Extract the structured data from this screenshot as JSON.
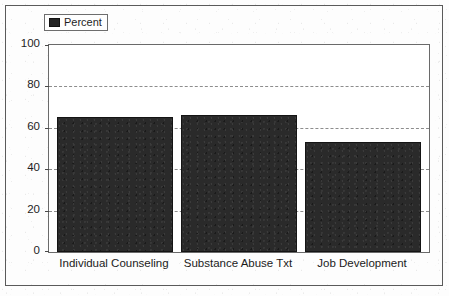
{
  "chart_data": {
    "type": "bar",
    "title": "",
    "subtitle": "",
    "xlabel": "",
    "ylabel": "",
    "categories": [
      "Individual Counseling",
      "Substance Abuse Txt",
      "Job Development"
    ],
    "values": [
      65,
      66,
      53
    ],
    "series": [
      {
        "name": "Percent",
        "values": [
          65,
          66,
          53
        ]
      }
    ],
    "ylim": [
      0,
      100
    ],
    "y_ticks": [
      0,
      20,
      40,
      60,
      80,
      100
    ],
    "y_tick_labels": [
      "0",
      "20",
      "40",
      "60",
      "80",
      "100"
    ],
    "grid": "horizontal-dashed",
    "legend_position": "top-left",
    "legend_entries": [
      "Percent"
    ],
    "bar_color": "#2a2a2a",
    "gridline_color": "#8d8d8d",
    "axis_color": "#6a6a6a",
    "plot_background": "#ffffff"
  },
  "legend": {
    "label": "Percent",
    "swatch_color": "#232323"
  },
  "axis": {
    "y_labels": [
      "100",
      "80",
      "60",
      "40",
      "20",
      "0"
    ]
  },
  "categories": [
    {
      "label": "Individual Counseling"
    },
    {
      "label": "Substance Abuse Txt"
    },
    {
      "label": "Job Development"
    }
  ]
}
